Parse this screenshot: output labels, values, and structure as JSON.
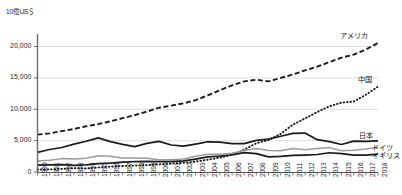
{
  "chart_data": {
    "type": "line",
    "title": "",
    "subtitle": "",
    "xlabel": "",
    "ylabel": "10億US＄",
    "ylim": [
      0,
      22000
    ],
    "xlim": [
      1990,
      2018
    ],
    "grid": true,
    "legend_position": "right-inline-labels",
    "yticks": [
      "0",
      "5,000",
      "10,000",
      "15,000",
      "20,000"
    ],
    "ytick_values": [
      0,
      5000,
      10000,
      15000,
      20000
    ],
    "x": [
      1990,
      1991,
      1992,
      1993,
      1994,
      1995,
      1996,
      1997,
      1998,
      1999,
      2000,
      2001,
      2002,
      2003,
      2004,
      2005,
      2006,
      2007,
      2008,
      2009,
      2010,
      2011,
      2012,
      2013,
      2014,
      2015,
      2016,
      2017,
      2018
    ],
    "xtick_labels": [
      "1990",
      "1991",
      "1992",
      "1993",
      "1994",
      "1995",
      "1996",
      "1997",
      "1998",
      "1999",
      "2000",
      "2001",
      "2002",
      "2003",
      "2004",
      "2005",
      "2006",
      "2007",
      "2008",
      "2009",
      "2010",
      "2011",
      "2012",
      "2013",
      "2014",
      "2015",
      "2016",
      "2017",
      "2018"
    ],
    "series": [
      {
        "name": "アメリカ",
        "label": "アメリカ",
        "style": "dashed",
        "color": "#1a1a1a",
        "values": [
          5963,
          6158,
          6520,
          6859,
          7287,
          7640,
          8073,
          8578,
          9063,
          9631,
          10252,
          10582,
          10936,
          11458,
          12214,
          13037,
          13815,
          14452,
          14713,
          14449,
          14992,
          15543,
          16197,
          16785,
          17527,
          18225,
          18715,
          19519,
          20580
        ]
      },
      {
        "name": "中国",
        "label": "中国",
        "style": "dotted",
        "color": "#1a1a1a",
        "values": [
          397,
          413,
          492,
          617,
          562,
          734,
          863,
          962,
          1029,
          1094,
          1211,
          1339,
          1470,
          1660,
          1955,
          2286,
          2752,
          3550,
          4594,
          5102,
          6087,
          7552,
          8532,
          9570,
          10476,
          11062,
          11233,
          12310,
          13608
        ]
      },
      {
        "name": "日本",
        "label": "日本",
        "style": "solid-thick",
        "color": "#1a1a1a",
        "values": [
          3133,
          3585,
          3909,
          4454,
          4907,
          5449,
          4834,
          4415,
          4041,
          4563,
          4888,
          4304,
          4115,
          4446,
          4816,
          4755,
          4530,
          4515,
          5038,
          5231,
          5700,
          6157,
          6203,
          5156,
          4850,
          4389,
          4927,
          4867,
          4971
        ]
      },
      {
        "name": "ドイツ",
        "label": "ドイツ",
        "style": "solid-gray",
        "color": "#9a9a9a",
        "values": [
          1771,
          1868,
          2133,
          2071,
          2205,
          2594,
          2505,
          2218,
          2244,
          2198,
          1950,
          1945,
          2079,
          2505,
          2814,
          2847,
          2995,
          3425,
          3745,
          3412,
          3396,
          3744,
          3528,
          3733,
          3890,
          3376,
          3467,
          3677,
          3948
        ]
      },
      {
        "name": "イギリス",
        "label": "イギリス",
        "style": "solid-thick",
        "color": "#1a1a1a",
        "values": [
          1093,
          1143,
          1180,
          1062,
          1140,
          1344,
          1422,
          1562,
          1648,
          1689,
          1660,
          1642,
          1786,
          2054,
          2421,
          2543,
          2713,
          3100,
          2929,
          2413,
          2485,
          2660,
          2705,
          2786,
          3065,
          2933,
          2689,
          2680,
          2861
        ]
      }
    ]
  }
}
